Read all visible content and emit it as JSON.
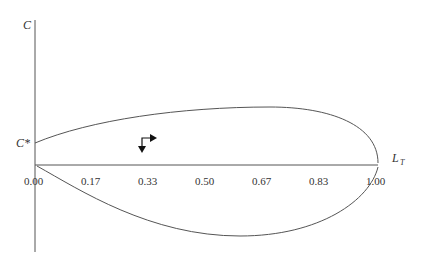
{
  "diagram": {
    "y_axis_label": "C",
    "y_marker_label": "C*",
    "x_axis_label_main": "L",
    "x_axis_label_sub": "T",
    "x_ticks": [
      "0.00",
      "0.17",
      "0.33",
      "0.50",
      "0.67",
      "0.83",
      "1.00"
    ],
    "direction_marker": "clockwise-arrows",
    "colors": {
      "line": "#555555",
      "text": "#333333",
      "arrow": "#111111"
    }
  }
}
